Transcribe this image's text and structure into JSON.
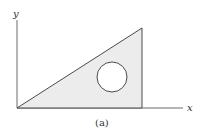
{
  "diagram": {
    "caption": "(a)",
    "axes": {
      "x_label": "x",
      "y_label": "y"
    },
    "shape": {
      "type": "right-triangle",
      "fill": "#ececec",
      "stroke": "#4a4a4a",
      "hole": {
        "type": "circle",
        "fill": "#ffffff"
      }
    }
  }
}
